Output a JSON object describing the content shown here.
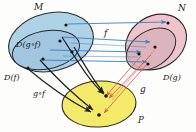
{
  "diagram": {
    "labels": {
      "set_m": "M",
      "set_n": "N",
      "set_p": "P",
      "domain_gof": "D(g∘f)",
      "domain_f": "D(f)",
      "domain_g": "D(g)",
      "map_f": "f",
      "map_g": "g",
      "map_gof": "g∘f"
    },
    "colors": {
      "set_m_fill": "#aed2e6",
      "set_m_inner_fill": "#9ec6dd",
      "set_n_fill": "#eec3cb",
      "set_n_inner_fill": "#d7b3b8",
      "set_p_fill": "#f4ea6a",
      "outline": "#2b2b2b",
      "arrow_f": "#3b7fc4",
      "arrow_g": "#d9604f",
      "arrow_gof": "#1e1e1e",
      "dot": "#141414",
      "background": "#fdfdfb"
    },
    "sets": [
      {
        "name": "M",
        "label": "M",
        "inner_label": "D(g∘f)",
        "outer_sub_label": "D(f)",
        "element_count": 4
      },
      {
        "name": "N",
        "label": "N",
        "inner_label": "D(g)",
        "element_count": 4
      },
      {
        "name": "P",
        "label": "P",
        "element_count": 2
      }
    ],
    "mappings": [
      {
        "name": "f",
        "from": "M",
        "to": "N",
        "color": "#3b7fc4",
        "arrow_count": 4
      },
      {
        "name": "g",
        "from": "N",
        "to": "P",
        "color": "#d9604f",
        "arrow_count": 3
      },
      {
        "name": "g∘f",
        "from": "M",
        "to": "P",
        "color": "#1e1e1e",
        "arrow_count": 4
      }
    ]
  }
}
